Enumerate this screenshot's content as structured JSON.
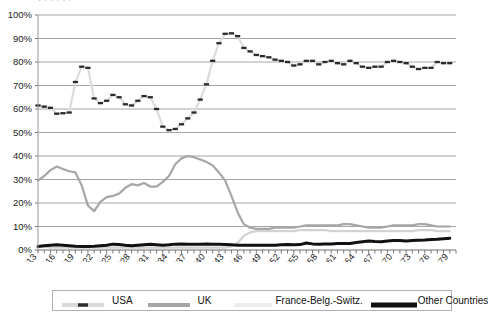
{
  "clipped_header": {
    "text": "·   ·      ·   ·     ·        ·"
  },
  "chart_data": {
    "type": "line",
    "title": "",
    "xlabel": "",
    "ylabel": "",
    "ylim": [
      0,
      100
    ],
    "ytick_labels": [
      "100%",
      "90%",
      "80%",
      "70%",
      "60%",
      "50%",
      "40%",
      "30%",
      "20%",
      "10%",
      "0%"
    ],
    "ytick_values": [
      100,
      90,
      80,
      70,
      60,
      50,
      40,
      30,
      20,
      10,
      0
    ],
    "xlim": [
      1913,
      1980
    ],
    "xtick_labels": [
      "1913",
      "1916",
      "1919",
      "1922",
      "1925",
      "1928",
      "1931",
      "1934",
      "1937",
      "1940",
      "1943",
      "1946",
      "1949",
      "1952",
      "1955",
      "1958",
      "1961",
      "1964",
      "1967",
      "1970",
      "1973",
      "1976",
      "1979"
    ],
    "xtick_values": [
      1913,
      1916,
      1919,
      1922,
      1925,
      1928,
      1931,
      1934,
      1937,
      1940,
      1943,
      1946,
      1949,
      1952,
      1955,
      1958,
      1961,
      1964,
      1967,
      1970,
      1973,
      1976,
      1979
    ],
    "x_minor_every": 1,
    "grid": "horizontal",
    "legend_position": "bottom",
    "x": [
      1913,
      1914,
      1915,
      1916,
      1917,
      1918,
      1919,
      1920,
      1921,
      1922,
      1923,
      1924,
      1925,
      1926,
      1927,
      1928,
      1929,
      1930,
      1931,
      1932,
      1933,
      1934,
      1935,
      1936,
      1937,
      1938,
      1939,
      1940,
      1941,
      1942,
      1943,
      1944,
      1945,
      1946,
      1947,
      1948,
      1949,
      1950,
      1951,
      1952,
      1953,
      1954,
      1955,
      1956,
      1957,
      1958,
      1959,
      1960,
      1961,
      1962,
      1963,
      1964,
      1965,
      1966,
      1967,
      1968,
      1969,
      1970,
      1971,
      1972,
      1973,
      1974,
      1975,
      1976,
      1977,
      1978,
      1979
    ],
    "series": [
      {
        "name": "USA",
        "color": "#2b2b2b",
        "style": "dashed",
        "values": [
          61.5,
          61.0,
          60.5,
          58.0,
          58.2,
          58.5,
          71.5,
          78.0,
          77.5,
          64.5,
          62.5,
          63.5,
          66.0,
          65.0,
          62.0,
          61.5,
          63.5,
          65.5,
          65.0,
          60.0,
          52.5,
          51.0,
          51.5,
          53.5,
          56.0,
          58.5,
          64.0,
          70.5,
          80.5,
          88.0,
          92.0,
          92.2,
          91.0,
          86.0,
          84.5,
          83.0,
          82.5,
          82.0,
          81.0,
          80.5,
          80.0,
          78.5,
          79.0,
          80.5,
          80.5,
          79.0,
          80.0,
          80.5,
          79.5,
          79.0,
          80.5,
          79.5,
          78.0,
          77.5,
          78.0,
          78.0,
          80.0,
          80.5,
          80.0,
          79.5,
          78.0,
          77.0,
          77.5,
          77.5,
          80.0,
          79.5,
          79.5
        ]
      },
      {
        "name": "UK",
        "color": "#a6a6a6",
        "style": "solid",
        "values": [
          29.5,
          31.5,
          34.0,
          35.5,
          34.5,
          33.5,
          33.0,
          27.5,
          19.0,
          16.5,
          20.5,
          22.5,
          23.0,
          24.0,
          26.5,
          28.0,
          27.5,
          28.5,
          27.0,
          27.0,
          29.0,
          31.5,
          36.5,
          39.0,
          40.0,
          39.5,
          38.5,
          37.5,
          36.0,
          33.0,
          29.5,
          23.0,
          16.0,
          11.0,
          9.5,
          9.0,
          9.0,
          9.0,
          9.5,
          9.5,
          9.5,
          9.5,
          10.0,
          10.5,
          10.5,
          10.5,
          10.5,
          10.5,
          10.5,
          11.0,
          11.0,
          10.5,
          10.0,
          9.5,
          9.5,
          9.5,
          10.0,
          10.5,
          10.5,
          10.5,
          10.5,
          11.0,
          11.0,
          10.5,
          10.0,
          10.0,
          10.0
        ]
      },
      {
        "name": "France-Belg.-Switz.",
        "color": "#d2d2d2",
        "style": "solid",
        "values": [
          1.5,
          1.5,
          1.0,
          1.0,
          1.0,
          1.0,
          1.0,
          1.0,
          1.0,
          1.0,
          1.0,
          1.0,
          1.0,
          1.0,
          1.0,
          1.0,
          1.0,
          1.0,
          1.0,
          1.0,
          1.0,
          1.0,
          1.0,
          1.0,
          1.0,
          1.0,
          1.0,
          1.0,
          1.0,
          1.0,
          1.0,
          1.5,
          3.0,
          6.0,
          7.5,
          8.0,
          8.0,
          8.0,
          8.0,
          8.0,
          8.0,
          8.0,
          8.5,
          8.5,
          8.5,
          8.5,
          8.5,
          8.0,
          8.0,
          8.0,
          8.0,
          8.0,
          8.0,
          8.0,
          8.0,
          8.0,
          8.0,
          8.0,
          8.0,
          8.0,
          8.0,
          8.5,
          8.5,
          8.5,
          8.0,
          8.0,
          8.0
        ]
      },
      {
        "name": "Other Countries",
        "color": "#111111",
        "style": "thick",
        "values": [
          1.5,
          1.8,
          2.0,
          2.2,
          2.0,
          1.8,
          1.6,
          1.5,
          1.5,
          1.6,
          1.8,
          2.0,
          2.5,
          2.3,
          2.0,
          1.8,
          2.0,
          2.2,
          2.4,
          2.2,
          2.0,
          2.2,
          2.5,
          2.6,
          2.5,
          2.4,
          2.5,
          2.6,
          2.5,
          2.4,
          2.3,
          2.2,
          2.0,
          2.0,
          2.0,
          2.0,
          2.0,
          2.0,
          2.0,
          2.2,
          2.3,
          2.2,
          2.3,
          3.0,
          2.6,
          2.5,
          2.6,
          2.6,
          2.8,
          2.8,
          2.8,
          3.2,
          3.5,
          3.8,
          3.6,
          3.5,
          3.8,
          4.0,
          4.0,
          3.8,
          4.0,
          4.2,
          4.3,
          4.5,
          4.6,
          4.8,
          5.0
        ]
      }
    ]
  },
  "legend": {
    "items": [
      {
        "label": "USA",
        "marker": "usa-dashed-swatch"
      },
      {
        "label": "UK",
        "marker": "uk-solid-swatch"
      },
      {
        "label": "France-Belg.-Switz.",
        "marker": "fbs-solid-swatch"
      },
      {
        "label": "Other Countries",
        "marker": "other-thick-swatch"
      }
    ]
  }
}
